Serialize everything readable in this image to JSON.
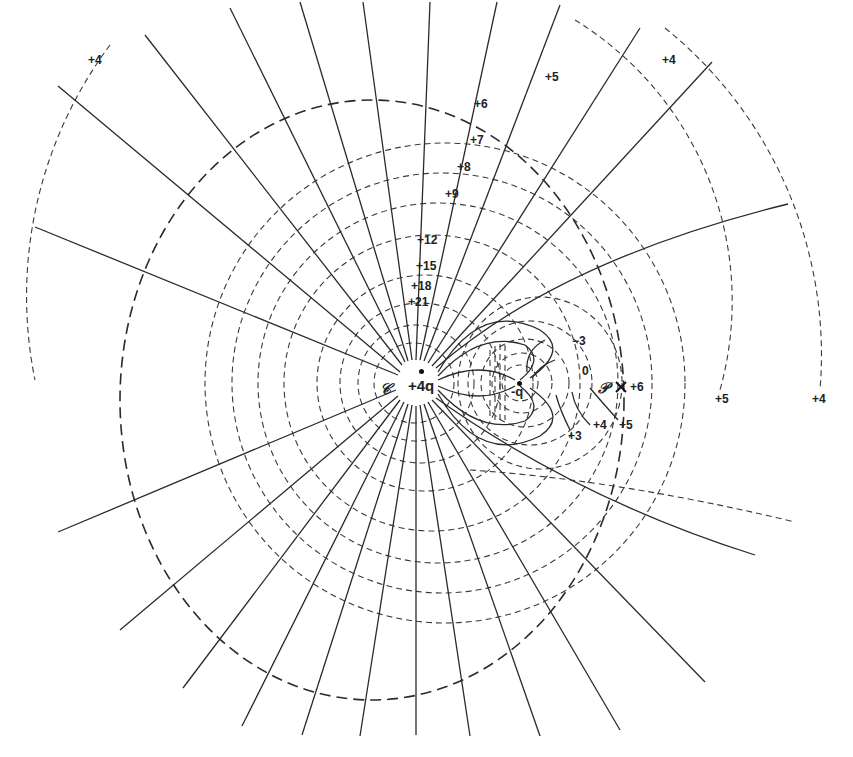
{
  "diagram": {
    "type": "electric-field-map",
    "charges": [
      {
        "id": "positive",
        "label": "+4q",
        "sign": "+",
        "magnitude": "4q"
      },
      {
        "id": "negative",
        "label": "-q",
        "sign": "-",
        "magnitude": "q"
      }
    ],
    "points": {
      "C": {
        "label": "𝒞"
      },
      "P": {
        "label": "𝒫",
        "marker": "×",
        "potential": "+6"
      }
    },
    "equipotential_labels": {
      "top_left": "+4",
      "top_mid": "+5",
      "top_right": "+4",
      "v6": "+6",
      "v7": "+7",
      "v8": "+8",
      "v9": "+9",
      "v12": "+12",
      "v15": "+15",
      "v18": "+18",
      "v21": "+21",
      "neg3": "−3",
      "zero": "0",
      "p3": "+3",
      "p4": "+4",
      "p5": "+5",
      "p6": "+6",
      "right5": "+5",
      "right4": "+4"
    },
    "legend": {
      "solid": "field line",
      "dashed": "equipotential"
    }
  }
}
